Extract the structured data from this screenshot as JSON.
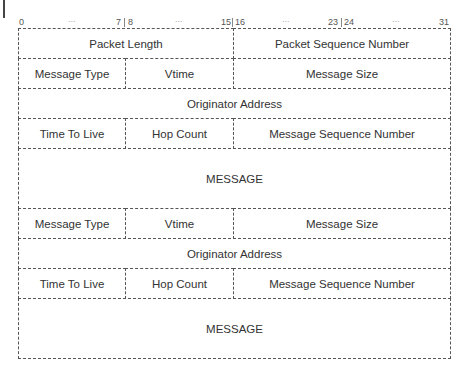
{
  "bit_ruler": {
    "labels": [
      {
        "text": "0",
        "x": 19
      },
      {
        "text": "7",
        "x": 118
      },
      {
        "text": "8",
        "x": 128
      },
      {
        "text": "15",
        "x": 222
      },
      {
        "text": "16",
        "x": 236
      },
      {
        "text": "23",
        "x": 330
      },
      {
        "text": "24",
        "x": 345
      },
      {
        "text": "31",
        "x": 440
      }
    ],
    "ellipsis": "..."
  },
  "rows": [
    {
      "cells": [
        {
          "label": "Packet Length",
          "span": [
            0,
            15
          ]
        },
        {
          "label": "Packet Sequence Number",
          "span": [
            16,
            31
          ]
        }
      ]
    },
    {
      "cells": [
        {
          "label": "Message Type",
          "span": [
            0,
            7
          ]
        },
        {
          "label": "Vtime",
          "span": [
            8,
            15
          ]
        },
        {
          "label": "Message Size",
          "span": [
            16,
            31
          ]
        }
      ]
    },
    {
      "cells": [
        {
          "label": "Originator Address",
          "span": [
            0,
            31
          ]
        }
      ]
    },
    {
      "cells": [
        {
          "label": "Time To Live",
          "span": [
            0,
            7
          ]
        },
        {
          "label": "Hop Count",
          "span": [
            8,
            15
          ]
        },
        {
          "label": "Message Sequence Number",
          "span": [
            16,
            31
          ]
        }
      ]
    },
    {
      "cells": [
        {
          "label": "MESSAGE",
          "span": [
            0,
            31
          ]
        }
      ]
    },
    {
      "cells": [
        {
          "label": "Message Type",
          "span": [
            0,
            7
          ]
        },
        {
          "label": "Vtime",
          "span": [
            8,
            15
          ]
        },
        {
          "label": "Message Size",
          "span": [
            16,
            31
          ]
        }
      ]
    },
    {
      "cells": [
        {
          "label": "Originator Address",
          "span": [
            0,
            31
          ]
        }
      ]
    },
    {
      "cells": [
        {
          "label": "Time To Live",
          "span": [
            0,
            7
          ]
        },
        {
          "label": "Hop Count",
          "span": [
            8,
            15
          ]
        },
        {
          "label": "Message Sequence Number",
          "span": [
            16,
            31
          ]
        }
      ]
    },
    {
      "cells": [
        {
          "label": "MESSAGE",
          "span": [
            0,
            31
          ]
        }
      ]
    }
  ]
}
